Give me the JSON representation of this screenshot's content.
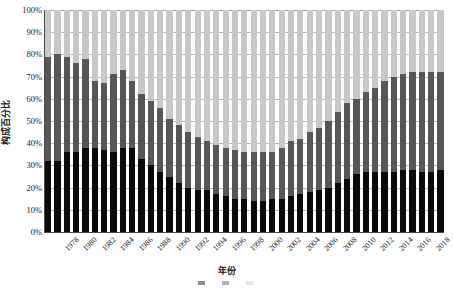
{
  "chart_data": {
    "type": "bar",
    "subtype": "stacked-100-percent",
    "title": "",
    "xlabel": "年份",
    "ylabel": "构成百分比",
    "ylim": [
      0,
      100
    ],
    "yticks": [
      "0%",
      "10%",
      "20%",
      "30%",
      "40%",
      "50%",
      "60%",
      "70%",
      "80%",
      "90%",
      "100%"
    ],
    "grid": true,
    "legend_position": "bottom",
    "xtick_interval": 2,
    "categories": [
      "1978",
      "1979",
      "1980",
      "1981",
      "1982",
      "1983",
      "1984",
      "1985",
      "1986",
      "1987",
      "1988",
      "1989",
      "1990",
      "1991",
      "1992",
      "1993",
      "1994",
      "1995",
      "1996",
      "1997",
      "1998",
      "1999",
      "2000",
      "2001",
      "2002",
      "2003",
      "2004",
      "2005",
      "2006",
      "2007",
      "2008",
      "2009",
      "2010",
      "2011",
      "2012",
      "2013",
      "2014",
      "2015",
      "2016",
      "2017",
      "2018",
      "2019",
      "2020"
    ],
    "xtick_labels": [
      "1978",
      "1980",
      "1982",
      "1984",
      "1986",
      "1988",
      "1990",
      "1992",
      "1994",
      "1996",
      "1998",
      "2000",
      "2002",
      "2004",
      "2006",
      "2008",
      "2010",
      "2012",
      "2014",
      "2016",
      "2018",
      "2020"
    ],
    "series": [
      {
        "name": "series-1",
        "color": "#0a0a0a",
        "values": [
          32,
          32,
          36,
          36,
          38,
          38,
          37,
          36,
          38,
          38,
          33,
          30,
          27,
          25,
          22,
          20,
          19,
          19,
          17,
          16,
          15,
          15,
          14,
          14,
          15,
          15,
          16,
          17,
          18,
          19,
          20,
          22,
          24,
          26,
          27,
          27,
          27,
          27,
          28,
          28,
          27,
          27,
          28
        ]
      },
      {
        "name": "series-2",
        "color": "#575757",
        "values": [
          47,
          48,
          43,
          40,
          40,
          30,
          30,
          35,
          35,
          30,
          29,
          29,
          29,
          26,
          26,
          25,
          24,
          22,
          22,
          22,
          22,
          21,
          22,
          22,
          21,
          23,
          25,
          25,
          27,
          28,
          30,
          32,
          34,
          34,
          36,
          38,
          41,
          43,
          43,
          44,
          45,
          45,
          44
        ]
      },
      {
        "name": "series-3",
        "color": "#c8c8c8",
        "values": [
          21,
          20,
          21,
          24,
          22,
          32,
          33,
          29,
          27,
          32,
          38,
          41,
          44,
          49,
          52,
          55,
          57,
          59,
          61,
          62,
          63,
          64,
          64,
          64,
          64,
          62,
          59,
          58,
          55,
          53,
          50,
          46,
          42,
          40,
          37,
          35,
          32,
          30,
          29,
          28,
          28,
          28,
          28
        ]
      }
    ]
  },
  "legend": {
    "items": [
      {
        "label": "",
        "color": "#0a0a0a"
      },
      {
        "label": "",
        "color": "#575757"
      },
      {
        "label": "",
        "color": "#c8c8c8"
      }
    ]
  }
}
